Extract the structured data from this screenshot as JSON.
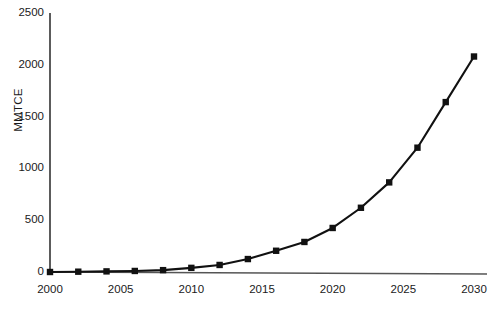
{
  "chart_data": {
    "type": "line",
    "title": "",
    "xlabel": "",
    "ylabel": "MMTCE",
    "x": [
      2000,
      2002,
      2004,
      2006,
      2008,
      2010,
      2012,
      2014,
      2016,
      2018,
      2020,
      2022,
      2024,
      2026,
      2028,
      2030
    ],
    "values": [
      0,
      3,
      6,
      10,
      18,
      40,
      68,
      125,
      205,
      290,
      425,
      620,
      865,
      1200,
      1640,
      2080
    ],
    "series": [
      {
        "name": "MMTCE",
        "values": [
          0,
          3,
          6,
          10,
          18,
          40,
          68,
          125,
          205,
          290,
          425,
          620,
          865,
          1200,
          1640,
          2080
        ]
      }
    ],
    "xlim": [
      2000,
      2030
    ],
    "ylim": [
      0,
      2500
    ],
    "xticks": [
      2000,
      2005,
      2010,
      2015,
      2020,
      2025,
      2030
    ],
    "xtick_labels": [
      "2000",
      "2005",
      "2010",
      "2015",
      "2020",
      "2025",
      "2030"
    ],
    "yticks": [
      0,
      500,
      1000,
      1500,
      2000,
      2500
    ],
    "ytick_labels": [
      "0",
      "500",
      "1000",
      "1500",
      "2000",
      "2500"
    ],
    "grid": false,
    "legend": false,
    "legend_position": "none",
    "marker": "square",
    "line_color": "#111111",
    "marker_color": "#111111",
    "axis_color": "#333333",
    "background_color": "#ffffff"
  }
}
